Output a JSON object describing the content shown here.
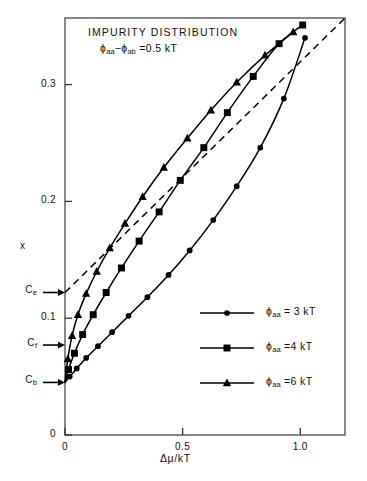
{
  "title": "IMPURITY DISTRIBUTION",
  "subtitle": {
    "phi1": "ϕ",
    "sub1": "aa",
    "minus": "−",
    "phi2": "ϕ",
    "sub2": "ab",
    "eq": "=0.5 kT"
  },
  "axes": {
    "ylabel": "x",
    "xlabel": "Δμ/kT",
    "yticks": [
      "0",
      "0.1",
      "0.2",
      "0.3"
    ],
    "xticks": [
      "0",
      "0.5",
      "1.0"
    ]
  },
  "annotations": [
    {
      "name": "Ce",
      "base": "C",
      "sub": "e",
      "value": 0.122
    },
    {
      "name": "Cf",
      "base": "C",
      "sub": "f",
      "value": 0.077
    },
    {
      "name": "Cb",
      "base": "C",
      "sub": "b",
      "value": 0.045
    }
  ],
  "legend": [
    {
      "marker": "circle",
      "phi": "ϕ",
      "sub": "aa",
      "eq": "= 3 kT"
    },
    {
      "marker": "square",
      "phi": "ϕ",
      "sub": "aa",
      "eq": "=4 kT"
    },
    {
      "marker": "triangle",
      "phi": "ϕ",
      "sub": "aa",
      "eq": "=6 kT"
    }
  ],
  "chart_data": {
    "type": "line",
    "title": "IMPURITY DISTRIBUTION",
    "subtitle": "ϕaa − ϕab = 0.5 kT",
    "xlabel": "Δμ/kT",
    "ylabel": "x",
    "xlim": [
      0,
      1.19
    ],
    "ylim": [
      0,
      0.357
    ],
    "xticks": [
      0,
      0.5,
      1.0
    ],
    "yticks": [
      0,
      0.1,
      0.2,
      0.3
    ],
    "grid": false,
    "legend_position": "center-right",
    "series": [
      {
        "name": "ϕaa = 3 kT",
        "marker": "circle",
        "x": [
          0.0,
          0.02,
          0.05,
          0.09,
          0.14,
          0.2,
          0.27,
          0.35,
          0.44,
          0.53,
          0.63,
          0.73,
          0.83,
          0.93,
          1.02
        ],
        "y": [
          0.045,
          0.05,
          0.057,
          0.066,
          0.076,
          0.088,
          0.102,
          0.118,
          0.137,
          0.158,
          0.184,
          0.213,
          0.246,
          0.288,
          0.34
        ]
      },
      {
        "name": "ϕaa = 4 kT",
        "marker": "square",
        "x": [
          0.0,
          0.015,
          0.04,
          0.075,
          0.12,
          0.175,
          0.24,
          0.315,
          0.4,
          0.49,
          0.59,
          0.69,
          0.8,
          0.91,
          1.01
        ],
        "y": [
          0.045,
          0.056,
          0.07,
          0.086,
          0.103,
          0.122,
          0.143,
          0.166,
          0.191,
          0.218,
          0.246,
          0.276,
          0.307,
          0.335,
          0.351
        ]
      },
      {
        "name": "ϕaa = 6 kT",
        "marker": "triangle",
        "x": [
          0.0,
          0.012,
          0.03,
          0.055,
          0.09,
          0.135,
          0.19,
          0.255,
          0.33,
          0.42,
          0.52,
          0.62,
          0.73,
          0.85,
          0.97
        ],
        "y": [
          0.045,
          0.065,
          0.085,
          0.103,
          0.121,
          0.14,
          0.16,
          0.181,
          0.204,
          0.229,
          0.254,
          0.278,
          0.302,
          0.325,
          0.345
        ]
      }
    ],
    "reference_line": {
      "name": "dashed asymptote",
      "style": "dashed",
      "x": [
        0.0,
        1.19
      ],
      "y": [
        0.122,
        0.357
      ]
    }
  }
}
